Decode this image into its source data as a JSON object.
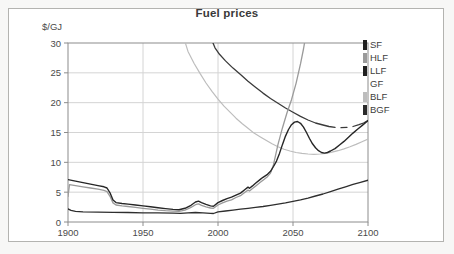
{
  "chart_data": {
    "type": "line",
    "title": "Fuel prices",
    "ylabel": "$/GJ",
    "xlabel": "",
    "xlim": [
      1900,
      2100
    ],
    "ylim": [
      0,
      30
    ],
    "xticks": [
      1900,
      1950,
      2000,
      2050,
      2100
    ],
    "yticks": [
      0,
      5,
      10,
      15,
      20,
      25,
      30
    ],
    "grid": true,
    "legend_position": "right-outside-top",
    "series": [
      {
        "name": "GF",
        "color": "#ffffff",
        "width": 1.2,
        "segments": [
          []
        ]
      },
      {
        "name": "BLF",
        "color": "#bdbdbd",
        "width": 1.2,
        "segments": [
          [
            [
              1977,
              31
            ],
            [
              1980,
              28.6
            ],
            [
              1984,
              26.6
            ],
            [
              1988,
              24.9
            ],
            [
              1992,
              23.3
            ],
            [
              1996,
              21.9
            ],
            [
              2000,
              20.6
            ],
            [
              2004,
              19.4
            ],
            [
              2008,
              18.4
            ],
            [
              2012,
              17.4
            ],
            [
              2016,
              16.5
            ],
            [
              2020,
              15.7
            ],
            [
              2024,
              14.9
            ],
            [
              2028,
              14.3
            ],
            [
              2032,
              13.7
            ],
            [
              2036,
              13.1
            ],
            [
              2040,
              12.6
            ],
            [
              2044,
              12.2
            ],
            [
              2048,
              11.9
            ],
            [
              2052,
              11.65
            ],
            [
              2056,
              11.5
            ],
            [
              2060,
              11.4
            ],
            [
              2064,
              11.35
            ],
            [
              2068,
              11.4
            ],
            [
              2072,
              11.5
            ],
            [
              2076,
              11.7
            ],
            [
              2080,
              11.95
            ],
            [
              2084,
              12.25
            ],
            [
              2088,
              12.6
            ],
            [
              2092,
              13.0
            ],
            [
              2096,
              13.45
            ],
            [
              2100,
              13.9
            ]
          ]
        ]
      },
      {
        "name": "BGF",
        "color": "#3a3a3a",
        "width": 1.3,
        "segments": [
          [
            [
              1995,
              31
            ],
            [
              1998,
              29.2
            ],
            [
              2001,
              28.1
            ],
            [
              2005,
              27.0
            ],
            [
              2010,
              25.8
            ],
            [
              2015,
              24.7
            ],
            [
              2020,
              23.6
            ],
            [
              2025,
              22.6
            ],
            [
              2030,
              21.6
            ],
            [
              2035,
              20.7
            ],
            [
              2040,
              19.9
            ],
            [
              2045,
              19.1
            ],
            [
              2050,
              18.4
            ],
            [
              2055,
              17.7
            ],
            [
              2060,
              17.1
            ],
            [
              2065,
              16.6
            ],
            [
              2070,
              16.25
            ],
            [
              2074,
              16.0
            ],
            [
              2078,
              15.85
            ]
          ],
          [
            [
              2082,
              15.8
            ],
            [
              2086,
              15.85
            ]
          ],
          [
            [
              2090,
              16.0
            ],
            [
              2094,
              16.3
            ],
            [
              2097,
              16.6
            ],
            [
              2100,
              17.0
            ]
          ]
        ]
      },
      {
        "name": "HLF",
        "color": "#9a9a9a",
        "width": 1.3,
        "segments": [
          [
            [
              1900,
              4.3
            ],
            [
              1901,
              6.25
            ],
            [
              1905,
              6.1
            ],
            [
              1910,
              5.9
            ],
            [
              1915,
              5.7
            ],
            [
              1920,
              5.5
            ],
            [
              1924,
              5.3
            ],
            [
              1926,
              5.1
            ],
            [
              1928,
              4.3
            ],
            [
              1930,
              3.2
            ],
            [
              1932,
              2.85
            ],
            [
              1936,
              2.7
            ],
            [
              1940,
              2.6
            ],
            [
              1945,
              2.45
            ],
            [
              1950,
              2.3
            ],
            [
              1955,
              2.15
            ],
            [
              1960,
              2.0
            ],
            [
              1965,
              1.9
            ],
            [
              1970,
              1.82
            ],
            [
              1974,
              1.78
            ],
            [
              1978,
              2.0
            ],
            [
              1982,
              2.45
            ],
            [
              1985,
              2.9
            ],
            [
              1987,
              3.05
            ],
            [
              1989,
              2.8
            ],
            [
              1992,
              2.55
            ],
            [
              1995,
              2.35
            ],
            [
              1997,
              2.3
            ],
            [
              2000,
              2.85
            ],
            [
              2003,
              3.2
            ],
            [
              2006,
              3.5
            ],
            [
              2009,
              3.7
            ],
            [
              2012,
              4.1
            ],
            [
              2015,
              4.4
            ],
            [
              2018,
              5.0
            ],
            [
              2020,
              5.35
            ],
            [
              2021,
              5.2
            ],
            [
              2023,
              5.6
            ],
            [
              2025,
              6.0
            ],
            [
              2028,
              6.6
            ],
            [
              2030,
              7.0
            ],
            [
              2033,
              7.6
            ],
            [
              2035,
              8.2
            ],
            [
              2037,
              9.6
            ],
            [
              2040,
              13.0
            ],
            [
              2043,
              15.8
            ],
            [
              2046,
              18.3
            ],
            [
              2049,
              20.5
            ],
            [
              2052,
              23.2
            ],
            [
              2055,
              26.5
            ],
            [
              2057,
              29.0
            ],
            [
              2059,
              32
            ]
          ]
        ]
      },
      {
        "name": "SF",
        "color": "#2e2e2e",
        "width": 1.3,
        "segments": [
          [
            [
              1900,
              2.2
            ],
            [
              1902,
              1.95
            ],
            [
              1905,
              1.8
            ],
            [
              1910,
              1.7
            ],
            [
              1920,
              1.65
            ],
            [
              1930,
              1.62
            ],
            [
              1940,
              1.6
            ],
            [
              1950,
              1.55
            ],
            [
              1960,
              1.52
            ],
            [
              1970,
              1.5
            ],
            [
              1975,
              1.45
            ],
            [
              1980,
              1.55
            ],
            [
              1985,
              1.6
            ],
            [
              1990,
              1.55
            ],
            [
              1995,
              1.45
            ],
            [
              1997,
              1.42
            ],
            [
              2000,
              1.7
            ],
            [
              2005,
              1.85
            ],
            [
              2010,
              2.0
            ],
            [
              2015,
              2.15
            ],
            [
              2020,
              2.3
            ],
            [
              2025,
              2.45
            ],
            [
              2030,
              2.6
            ],
            [
              2035,
              2.8
            ],
            [
              2040,
              3.0
            ],
            [
              2045,
              3.2
            ],
            [
              2050,
              3.45
            ],
            [
              2055,
              3.7
            ],
            [
              2060,
              4.0
            ],
            [
              2065,
              4.35
            ],
            [
              2070,
              4.7
            ],
            [
              2075,
              5.1
            ],
            [
              2080,
              5.5
            ],
            [
              2085,
              5.9
            ],
            [
              2090,
              6.3
            ],
            [
              2095,
              6.65
            ],
            [
              2100,
              7.0
            ]
          ]
        ]
      },
      {
        "name": "LLF",
        "color": "#262626",
        "width": 1.4,
        "segments": [
          [
            [
              1900,
              7.1
            ],
            [
              1905,
              6.85
            ],
            [
              1910,
              6.6
            ],
            [
              1915,
              6.35
            ],
            [
              1920,
              6.1
            ],
            [
              1924,
              5.9
            ],
            [
              1926,
              5.7
            ],
            [
              1928,
              4.9
            ],
            [
              1930,
              3.7
            ],
            [
              1932,
              3.25
            ],
            [
              1936,
              3.1
            ],
            [
              1940,
              3.0
            ],
            [
              1945,
              2.85
            ],
            [
              1950,
              2.7
            ],
            [
              1955,
              2.55
            ],
            [
              1960,
              2.4
            ],
            [
              1965,
              2.25
            ],
            [
              1970,
              2.12
            ],
            [
              1974,
              2.05
            ],
            [
              1978,
              2.3
            ],
            [
              1982,
              2.8
            ],
            [
              1985,
              3.35
            ],
            [
              1987,
              3.5
            ],
            [
              1989,
              3.25
            ],
            [
              1992,
              2.95
            ],
            [
              1995,
              2.7
            ],
            [
              1997,
              2.65
            ],
            [
              2000,
              3.25
            ],
            [
              2003,
              3.6
            ],
            [
              2006,
              3.9
            ],
            [
              2009,
              4.15
            ],
            [
              2012,
              4.5
            ],
            [
              2015,
              4.85
            ],
            [
              2018,
              5.45
            ],
            [
              2020,
              5.85
            ],
            [
              2021,
              5.65
            ],
            [
              2023,
              6.05
            ],
            [
              2025,
              6.5
            ],
            [
              2028,
              7.1
            ],
            [
              2030,
              7.5
            ],
            [
              2033,
              8.0
            ],
            [
              2035,
              8.5
            ],
            [
              2037,
              9.3
            ],
            [
              2039,
              10.2
            ],
            [
              2041,
              11.5
            ],
            [
              2043,
              13.0
            ],
            [
              2045,
              14.4
            ],
            [
              2047,
              15.5
            ],
            [
              2049,
              16.3
            ],
            [
              2051,
              16.75
            ],
            [
              2053,
              16.85
            ],
            [
              2055,
              16.55
            ],
            [
              2057,
              15.9
            ],
            [
              2059,
              15.0
            ],
            [
              2061,
              14.0
            ],
            [
              2063,
              13.1
            ],
            [
              2065,
              12.45
            ],
            [
              2067,
              11.95
            ],
            [
              2069,
              11.65
            ],
            [
              2071,
              11.55
            ],
            [
              2073,
              11.65
            ],
            [
              2075,
              11.9
            ],
            [
              2078,
              12.3
            ],
            [
              2081,
              12.9
            ],
            [
              2084,
              13.5
            ],
            [
              2087,
              14.2
            ],
            [
              2090,
              14.9
            ],
            [
              2093,
              15.55
            ],
            [
              2096,
              16.15
            ],
            [
              2100,
              17.0
            ]
          ]
        ]
      }
    ]
  },
  "legend": {
    "items": [
      {
        "label": "SF",
        "color": "#1f1f1f"
      },
      {
        "label": "HLF",
        "color": "#9a9a9a"
      },
      {
        "label": "LLF",
        "color": "#1f1f1f"
      },
      {
        "label": "GF",
        "color": "#ffffff"
      },
      {
        "label": "BLF",
        "color": "#bdbdbd"
      },
      {
        "label": "BGF",
        "color": "#2a2a2a"
      }
    ]
  },
  "colors": {
    "grid": "#d4d4d4",
    "plot_border": "#8c8c8c",
    "tick_label": "#4a4a4a",
    "frame_border": "#b3b3b0"
  }
}
